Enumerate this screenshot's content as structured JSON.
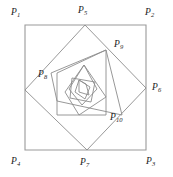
{
  "figure": {
    "type": "geometric-diagram",
    "canvas": {
      "width": 173,
      "height": 177
    },
    "stroke_color": "#8c8c8c",
    "label_color": "#1a1a1a",
    "background_color": "#ffffff",
    "labels": [
      {
        "id": "P1",
        "base": "P",
        "sub": "1",
        "x": 11,
        "y": 8
      },
      {
        "id": "P2",
        "base": "P",
        "sub": "2",
        "x": 145,
        "y": 8
      },
      {
        "id": "P3",
        "base": "P",
        "sub": "3",
        "x": 146,
        "y": 157
      },
      {
        "id": "P4",
        "base": "P",
        "sub": "4",
        "x": 11,
        "y": 157
      },
      {
        "id": "P5",
        "base": "P",
        "sub": "5",
        "x": 78,
        "y": 6
      },
      {
        "id": "P6",
        "base": "P",
        "sub": "6",
        "x": 152,
        "y": 83
      },
      {
        "id": "P7",
        "base": "P",
        "sub": "7",
        "x": 80,
        "y": 158
      },
      {
        "id": "P8",
        "base": "P",
        "sub": "8",
        "x": 38,
        "y": 70
      },
      {
        "id": "P9",
        "base": "P",
        "sub": "9",
        "x": 114,
        "y": 40
      },
      {
        "id": "P10",
        "base": "P",
        "sub": "10",
        "x": 110,
        "y": 113
      }
    ],
    "polygons": [
      {
        "name": "square-outer",
        "vertices": "P1 P2 P3 P4",
        "points": "25,25 146,25 146,150 25,150"
      },
      {
        "name": "square-2",
        "vertices": "P5 P6 P7 P8",
        "points": "85,25 146,88 87,150 25,90"
      },
      {
        "name": "square-3",
        "vertices": "P9 P10 inner",
        "points": "106,50 122,115 57,101 51,73"
      },
      {
        "name": "square-4",
        "points": "106,50 106,115 57,115 57,73"
      },
      {
        "name": "square-5",
        "points": "84,65 106,97 79,115 65,92"
      },
      {
        "name": "square-6",
        "points": "84,65 97,89 82,105 69,89"
      },
      {
        "name": "square-7",
        "points": "72,78 95,82 91,102 70,98"
      },
      {
        "name": "square-8",
        "points": "79,80 90,87 85,99 75,92"
      },
      {
        "name": "square-9",
        "points": "79,80 79,92 89,95 86,84"
      }
    ]
  }
}
